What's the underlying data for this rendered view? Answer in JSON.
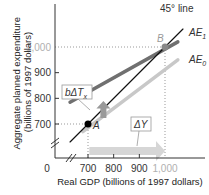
{
  "chart_data": {
    "type": "line",
    "title": "",
    "xlabel": "Real GDP (billions of 1997 dollars)",
    "ylabel": "Aggregate planned expenditure (billions of 1997 dollars)",
    "xlim": [
      600,
      1100
    ],
    "ylim": [
      600,
      1100
    ],
    "x_ticks": [
      "0",
      "700",
      "800",
      "900",
      "1,000"
    ],
    "y_ticks": [
      "700",
      "800",
      "900",
      "1,000"
    ],
    "series": [
      {
        "name": "45° line",
        "x": [
          630,
          1070
        ],
        "y": [
          630,
          1070
        ],
        "color": "#111111"
      },
      {
        "name": "AE1",
        "label_main": "AE",
        "label_sub": "1",
        "x": [
          630,
          1050
        ],
        "y": [
          785,
          1020
        ],
        "color": "#707070"
      },
      {
        "name": "AE0",
        "label_main": "AE",
        "label_sub": "0",
        "x": [
          680,
          1050
        ],
        "y": [
          670,
          950
        ],
        "color": "#c8c8c8"
      }
    ],
    "points": [
      {
        "label": "A",
        "x": 700,
        "y": 700
      },
      {
        "label": "B",
        "x": 1000,
        "y": 1000
      }
    ],
    "annotations": {
      "line45": "45° line",
      "tax_shift": "bΔT",
      "tax_shift_sub": "x",
      "gdp_change": "ΔY"
    },
    "axis_break": true,
    "grid": false,
    "guides": "dotted lines from A and B to axes"
  }
}
